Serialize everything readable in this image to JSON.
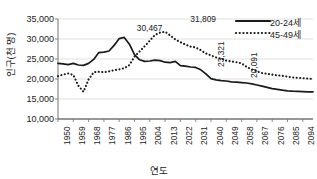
{
  "chart_data": {
    "type": "line",
    "title": "",
    "xlabel": "연도",
    "ylabel": "인구(천 명)",
    "ylim": [
      10000,
      35000
    ],
    "ytick_labels": [
      "35,000",
      "30,000",
      "25,000",
      "20,000",
      "15,000",
      "10,000"
    ],
    "ytick_values": [
      35000,
      30000,
      25000,
      20000,
      15000,
      10000
    ],
    "xlim": [
      1950,
      2100
    ],
    "xtick_labels": [
      "1950",
      "1959",
      "1968",
      "1977",
      "1986",
      "1995",
      "2004",
      "2013",
      "2022",
      "2031",
      "2040",
      "2049",
      "2058",
      "2067",
      "2076",
      "2085",
      "2094"
    ],
    "xtick_values": [
      1950,
      1959,
      1968,
      1977,
      1986,
      1995,
      2004,
      2013,
      2022,
      2031,
      2040,
      2049,
      2058,
      2067,
      2076,
      2085,
      2094
    ],
    "grid": "horizontal",
    "legend_position": "top-right",
    "series": [
      {
        "name": "20-24세",
        "style": "solid",
        "color": "#1a1a1a",
        "x": [
          1950,
          1953,
          1956,
          1959,
          1962,
          1965,
          1968,
          1971,
          1974,
          1977,
          1980,
          1983,
          1986,
          1989,
          1992,
          1995,
          1998,
          2001,
          2004,
          2007,
          2010,
          2013,
          2016,
          2019,
          2022,
          2025,
          2028,
          2031,
          2034,
          2037,
          2040,
          2043,
          2046,
          2049,
          2052,
          2055,
          2058,
          2061,
          2064,
          2067,
          2070,
          2073,
          2076,
          2079,
          2082,
          2085,
          2088,
          2091,
          2094,
          2097,
          2100
        ],
        "values": [
          23900,
          23800,
          23600,
          23900,
          23500,
          23400,
          23900,
          24900,
          26600,
          26700,
          27000,
          28400,
          30100,
          30400,
          28700,
          26100,
          24800,
          24400,
          24500,
          24700,
          24600,
          24200,
          24100,
          24400,
          23321,
          23200,
          23000,
          22900,
          22300,
          21300,
          20091,
          19800,
          19600,
          19500,
          19300,
          19200,
          19100,
          19000,
          18800,
          18500,
          18200,
          17900,
          17600,
          17400,
          17200,
          17050,
          16950,
          16900,
          16850,
          16800,
          16800
        ]
      },
      {
        "name": "45-49세",
        "style": "dotted",
        "color": "#1a1a1a",
        "x": [
          1950,
          1953,
          1956,
          1959,
          1962,
          1965,
          1968,
          1971,
          1974,
          1977,
          1980,
          1983,
          1986,
          1989,
          1992,
          1995,
          1998,
          2001,
          2004,
          2007,
          2010,
          2013,
          2016,
          2019,
          2022,
          2025,
          2028,
          2031,
          2034,
          2037,
          2040,
          2043,
          2046,
          2049,
          2052,
          2055,
          2058,
          2061,
          2064,
          2067,
          2070,
          2073,
          2076,
          2079,
          2082,
          2085,
          2088,
          2091,
          2094,
          2097,
          2100
        ],
        "values": [
          20700,
          21100,
          21400,
          21000,
          18300,
          16800,
          19900,
          21700,
          21800,
          21700,
          21900,
          22200,
          22400,
          22700,
          23500,
          25600,
          26900,
          28200,
          29600,
          31000,
          31600,
          31809,
          30900,
          29900,
          29200,
          28600,
          28100,
          27900,
          27200,
          26400,
          25900,
          25400,
          25100,
          24600,
          24400,
          24200,
          23900,
          23000,
          22400,
          21900,
          21500,
          21300,
          21100,
          20900,
          20800,
          20600,
          20400,
          20300,
          20200,
          20100,
          20000
        ]
      }
    ],
    "annotations": [
      {
        "label": "30,467",
        "rotated": false,
        "x_pct": 36.0,
        "y_px": 23
      },
      {
        "label": "31,809",
        "rotated": false,
        "x_pct": 57.0,
        "y_px": 14
      },
      {
        "label": "23,321",
        "rotated": true,
        "x_pct": 60.5,
        "y_px": 67
      },
      {
        "label": "20,091",
        "rotated": true,
        "x_pct": 73.5,
        "y_px": 78
      }
    ],
    "legend": [
      {
        "label": "20-24세",
        "style": "solid"
      },
      {
        "label": "45-49세",
        "style": "dotted"
      }
    ]
  }
}
